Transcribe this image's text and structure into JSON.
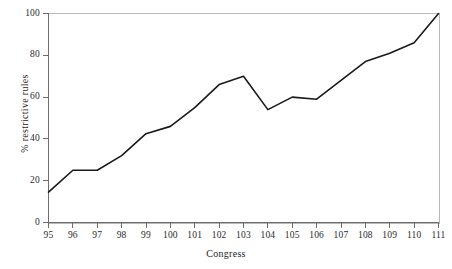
{
  "chart_data": {
    "type": "line",
    "title": "",
    "xlabel": "Congress",
    "ylabel": "% restrictive rules",
    "categories": [
      "95",
      "96",
      "97",
      "98",
      "99",
      "100",
      "101",
      "102",
      "103",
      "104",
      "105",
      "106",
      "107",
      "108",
      "109",
      "110",
      "111"
    ],
    "x": [
      95,
      96,
      97,
      98,
      99,
      100,
      101,
      102,
      103,
      104,
      105,
      106,
      107,
      108,
      109,
      110,
      111
    ],
    "values": [
      14.5,
      25,
      25,
      32,
      42.5,
      46,
      55,
      66,
      70,
      54,
      60,
      59,
      68,
      77,
      81,
      86,
      100
    ],
    "series": [
      {
        "name": "% restrictive rules",
        "values": [
          14.5,
          25,
          25,
          32,
          42.5,
          46,
          55,
          66,
          70,
          54,
          60,
          59,
          68,
          77,
          81,
          86,
          100
        ]
      }
    ],
    "xlim": [
      95,
      111
    ],
    "ylim": [
      0,
      100
    ],
    "yticks": [
      0,
      20,
      40,
      60,
      80,
      100
    ],
    "ytick_labels": [
      "0",
      "20",
      "40",
      "60",
      "80",
      "100"
    ],
    "xticks": [
      95,
      96,
      97,
      98,
      99,
      100,
      101,
      102,
      103,
      104,
      105,
      106,
      107,
      108,
      109,
      110,
      111
    ],
    "xtick_labels": [
      "95",
      "96",
      "97",
      "98",
      "99",
      "100",
      "101",
      "102",
      "103",
      "104",
      "105",
      "106",
      "107",
      "108",
      "109",
      "110",
      "111"
    ],
    "grid": false,
    "legend": null,
    "legend_position": "none",
    "line_color": "#1a1a1a",
    "line_width": 1.6,
    "background_color": "#ffffff",
    "frame_color": "#b9b9b9",
    "axis_color": "#6d6d6d",
    "markers": false,
    "annotations": []
  }
}
